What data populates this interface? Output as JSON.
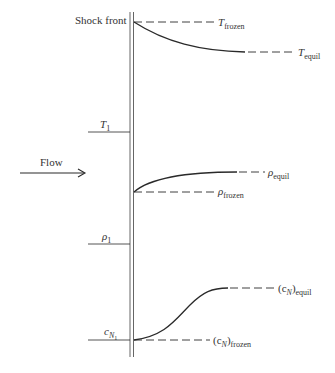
{
  "diagram": {
    "title": "Shock front",
    "flow_label": "Flow",
    "upstream_labels": {
      "temperature": {
        "symbol": "T",
        "subscript": "1"
      },
      "density": {
        "symbol": "ρ",
        "subscript": "1"
      },
      "concentration": {
        "symbol": "c",
        "subscript": "N",
        "subsubscript": "1"
      }
    },
    "curves": [
      {
        "name": "temperature",
        "frozen_label": {
          "symbol": "T",
          "subscript": "frozen"
        },
        "equil_label": {
          "symbol": "T",
          "subscript": "equil"
        },
        "trend": "decreasing"
      },
      {
        "name": "density",
        "frozen_label": {
          "symbol": "ρ",
          "subscript": "frozen"
        },
        "equil_label": {
          "symbol": "ρ",
          "subscript": "equil"
        },
        "trend": "increasing"
      },
      {
        "name": "concentration",
        "frozen_label": {
          "symbol": "(c",
          "subscript_inner": "N",
          "close": ")",
          "subscript": "frozen"
        },
        "equil_label": {
          "symbol": "(c",
          "subscript_inner": "N",
          "close": ")",
          "subscript": "equil"
        },
        "trend": "s-curve increasing"
      }
    ],
    "colors": {
      "line": "#2a2a2a",
      "shock": "#555555",
      "background": "#ffffff"
    }
  }
}
